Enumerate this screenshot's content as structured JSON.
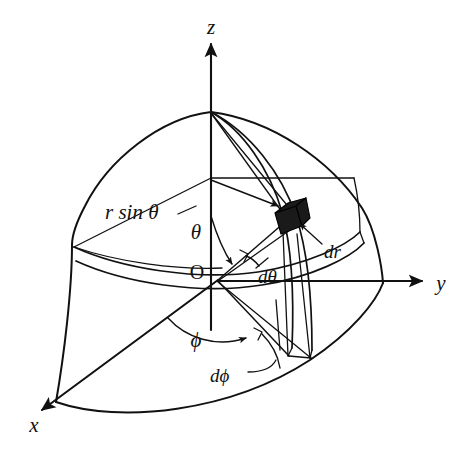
{
  "figure": {
    "name": "spherical-coordinate-volume-element",
    "background_color": "#ffffff",
    "ink_color": "#111111"
  },
  "axes": [
    {
      "id": "z",
      "label": "z",
      "label_x": 211,
      "label_y": 34,
      "direction": "up"
    },
    {
      "id": "y",
      "label": "y",
      "label_x": 441,
      "label_y": 290,
      "direction": "right"
    },
    {
      "id": "x",
      "label": "x",
      "label_x": 34,
      "label_y": 432,
      "direction": "down-left"
    }
  ],
  "labels": {
    "origin": {
      "text": "O",
      "x": 197,
      "y": 279
    },
    "r_sin_theta": {
      "text": "r sin θ",
      "x": 105,
      "y": 219
    },
    "theta": {
      "text": "θ",
      "x": 196,
      "y": 239
    },
    "phi": {
      "text": "ϕ",
      "x": 196,
      "y": 347
    },
    "d_theta": {
      "text": "dθ",
      "x": 258,
      "y": 275
    },
    "d_phi": {
      "text": "dϕ",
      "x": 224,
      "y": 378
    },
    "d_r": {
      "text": "dr",
      "x": 327,
      "y": 248
    }
  },
  "geometry": {
    "origin": {
      "x": 218,
      "y": 280
    },
    "north_pole": {
      "x": 211,
      "y": 112
    },
    "volume_element": {
      "x": 288,
      "y": 219,
      "width": 26,
      "height": 24
    },
    "sphere_radius_px": 168,
    "z_axis_tip": {
      "x": 211,
      "y": 42
    },
    "y_axis_tip": {
      "x": 424,
      "y": 282
    },
    "x_axis_tip": {
      "x": 38,
      "y": 413
    }
  },
  "caption": ""
}
